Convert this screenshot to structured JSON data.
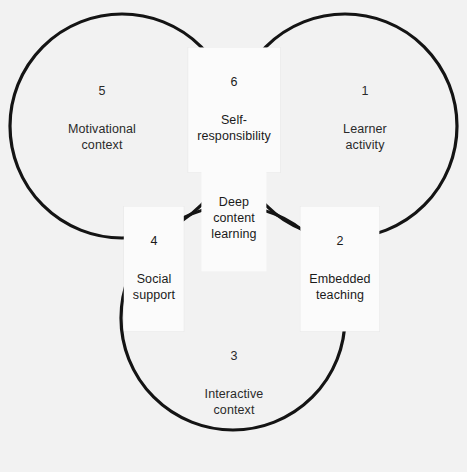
{
  "figure": {
    "type": "venn-diagram",
    "set_count": 3,
    "background_color": "#f2f2f2",
    "stroke_color": "#141414",
    "pair_overlap_color": "#b8b8b8",
    "triple_overlap_color": "#4a4a4a",
    "label_box_color": "#fbfbfb",
    "caption_remnant": "            ",
    "circles": [
      {
        "name": "learner-activity-circle",
        "cx": 345,
        "cy": 126,
        "r": 112
      },
      {
        "name": "motivational-context-circle",
        "cx": 122,
        "cy": 126,
        "r": 112
      },
      {
        "name": "interactive-context-circle",
        "cx": 233,
        "cy": 318,
        "r": 112
      }
    ]
  },
  "regions": [
    {
      "id": "region-1",
      "number": "1",
      "title": "Learner\nactivity",
      "style": "plain",
      "x": 365,
      "y": 118
    },
    {
      "id": "region-2",
      "number": "2",
      "title": "Embedded\nteaching",
      "style": "boxed",
      "x": 340,
      "y": 269
    },
    {
      "id": "region-3",
      "number": "3",
      "title": "Interactive\ncontext",
      "style": "plain",
      "x": 234,
      "y": 383
    },
    {
      "id": "region-4",
      "number": "4",
      "title": "Social\nsupport",
      "style": "boxed",
      "x": 154,
      "y": 269
    },
    {
      "id": "region-5",
      "number": "5",
      "title": "Motivational\ncontext",
      "style": "plain",
      "x": 102,
      "y": 118
    },
    {
      "id": "region-6",
      "number": "6",
      "title": "Self-\nresponsibility",
      "style": "boxed",
      "x": 234,
      "y": 110
    }
  ],
  "center": {
    "id": "region-center",
    "title": "Deep\ncontent\nlearning",
    "x": 234,
    "y": 219
  }
}
